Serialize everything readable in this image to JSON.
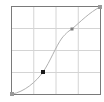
{
  "widget": {
    "type": "tone-curve-editor",
    "grid_divisions": 4,
    "frame_color": "#7a7a7a",
    "grid_color": "#d4d4d4",
    "curve_color": "#b0b0b0",
    "background": "#ffffff"
  },
  "curve": {
    "points": [
      {
        "name": "black-point",
        "x": 0.0,
        "y": 0.0,
        "color": "#9a9a9a"
      },
      {
        "name": "shadow-control-point",
        "x": 0.35,
        "y": 0.25,
        "color": "#1a1a1a",
        "selected": true
      },
      {
        "name": "highlight-control-point",
        "x": 0.67,
        "y": 0.74,
        "color": "#7d7d7d"
      },
      {
        "name": "white-point",
        "x": 1.0,
        "y": 1.0,
        "color": "#9a9a9a"
      }
    ]
  }
}
